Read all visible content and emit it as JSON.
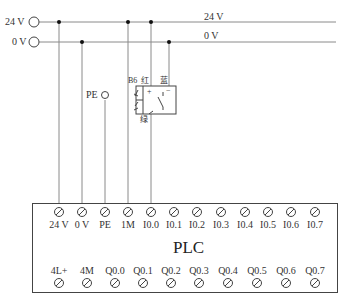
{
  "rails": {
    "left_labels": [
      {
        "id": "rail-24v",
        "label": "24 V",
        "y": 22
      },
      {
        "id": "rail-0v",
        "label": "0 V",
        "y": 42
      }
    ],
    "right_labels": [
      {
        "label": "24 V"
      },
      {
        "label": "0 V"
      }
    ]
  },
  "pe_node": {
    "label": "PE"
  },
  "sensor": {
    "tag": "B6",
    "wire_red": "红",
    "wire_blue": "蓝",
    "wire_green": "绿",
    "plus": "+",
    "minus": "−"
  },
  "plc": {
    "title": "PLC",
    "top_terminals": [
      "24 V",
      "0 V",
      "PE",
      "1M",
      "I0.0",
      "I0.1",
      "I0.2",
      "I0.3",
      "I0.4",
      "I0.5",
      "I0.6",
      "I0.7"
    ],
    "bottom_terminals": [
      "4L+",
      "4M",
      "Q0.0",
      "Q0.1",
      "Q0.2",
      "Q0.3",
      "Q0.4",
      "Q0.5",
      "Q0.6",
      "Q0.7"
    ]
  },
  "colors": {
    "line": "#555555",
    "wire": "#777777",
    "dot": "#111111"
  }
}
